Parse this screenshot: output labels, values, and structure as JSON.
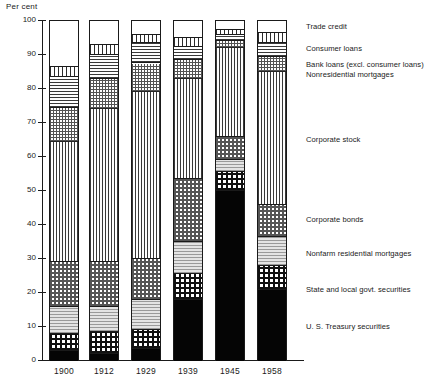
{
  "chart_data": {
    "type": "bar",
    "stacked": true,
    "title": "",
    "ylabel": "Per cent",
    "xlabel": "",
    "ylim": [
      0,
      100
    ],
    "yticks": [
      0,
      10,
      20,
      30,
      40,
      50,
      60,
      70,
      80,
      90,
      100
    ],
    "ytick_labels": [
      "0",
      "10",
      "20",
      "30",
      "40",
      "50",
      "60",
      "70",
      "80",
      "90",
      "100"
    ],
    "grid": false,
    "legend_position": "right",
    "categories": [
      "1900",
      "1912",
      "1929",
      "1939",
      "1945",
      "1958"
    ],
    "series": [
      {
        "name": "U. S. Treasury securities",
        "pattern": "us-treasury",
        "values": [
          3.0,
          2.0,
          3.5,
          18.0,
          50.0,
          21.0
        ]
      },
      {
        "name": "State and local govt. securities",
        "pattern": "state-local",
        "values": [
          5.0,
          6.5,
          5.5,
          7.5,
          5.5,
          7.0
        ]
      },
      {
        "name": "Nonfarm residential mortgages",
        "pattern": "nonfarm-mortgages",
        "values": [
          8.0,
          7.5,
          9.0,
          9.5,
          3.5,
          8.5
        ]
      },
      {
        "name": "Corporate bonds",
        "pattern": "corporate-bonds",
        "values": [
          13.0,
          13.0,
          12.0,
          18.5,
          7.0,
          9.5
        ]
      },
      {
        "name": "Corporate stock",
        "pattern": "corporate-stock",
        "values": [
          35.5,
          45.0,
          49.0,
          29.5,
          26.0,
          39.0
        ]
      },
      {
        "name": "Nonresidential mortgages",
        "pattern": "nonres-mortgages",
        "values": [
          10.0,
          9.0,
          8.5,
          5.5,
          2.0,
          4.5
        ]
      },
      {
        "name": "Bank loans (excl. consumer loans)",
        "pattern": "bank-loans",
        "values": [
          9.0,
          7.0,
          6.0,
          4.0,
          2.0,
          4.0
        ]
      },
      {
        "name": "Consumer loans",
        "pattern": "consumer-loans",
        "values": [
          3.0,
          3.0,
          2.5,
          2.5,
          1.5,
          3.0
        ]
      },
      {
        "name": "Trade credit",
        "pattern": "trade-credit",
        "values": [
          13.5,
          7.0,
          4.0,
          5.0,
          2.5,
          3.5
        ]
      }
    ],
    "legend_entries": [
      "Trade credit",
      "Consumer loans",
      "Bank loans (excl. consumer loans)",
      "Nonresidential mortgages",
      "Corporate stock",
      "Corporate bonds",
      "Nonfarm residential mortgages",
      "State and local govt. securities",
      "U. S. Treasury securities"
    ]
  },
  "colors": {
    "ink": "#1a1a1a",
    "background": "#ffffff",
    "solid_fill": "#050505"
  }
}
